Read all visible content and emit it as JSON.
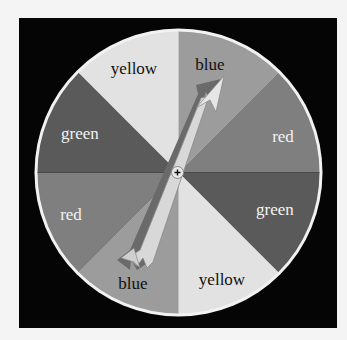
{
  "spinner": {
    "center": {
      "x": 178.5,
      "y": 172.5
    },
    "radius": 141,
    "background": "#050505",
    "rim_color": "#f2f2f2",
    "segments": [
      {
        "label": "blue",
        "fill": "#9c9c9c",
        "text_color": "#111111"
      },
      {
        "label": "red",
        "fill": "#7f7f7f",
        "text_color": "#f2f2f2"
      },
      {
        "label": "green",
        "fill": "#5a5a5a",
        "text_color": "#f2f2f2"
      },
      {
        "label": "yellow",
        "fill": "#e2e2e2",
        "text_color": "#111111"
      },
      {
        "label": "blue",
        "fill": "#9c9c9c",
        "text_color": "#111111"
      },
      {
        "label": "red",
        "fill": "#7f7f7f",
        "text_color": "#f2f2f2"
      },
      {
        "label": "green",
        "fill": "#5a5a5a",
        "text_color": "#f2f2f2"
      },
      {
        "label": "yellow",
        "fill": "#e2e2e2",
        "text_color": "#111111"
      }
    ],
    "pointer": {
      "points_to": "blue"
    }
  }
}
